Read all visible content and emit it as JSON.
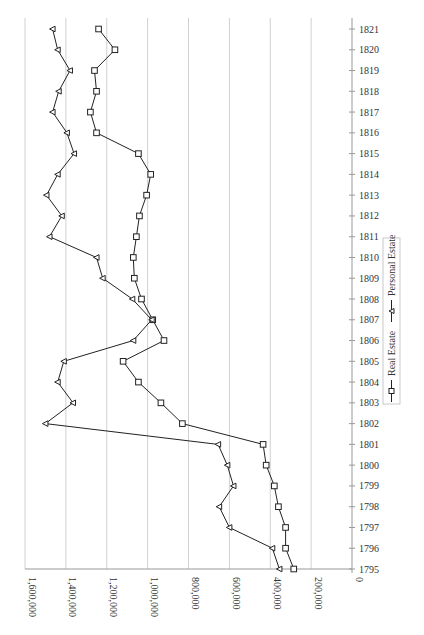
{
  "chart_data": {
    "type": "line",
    "orientation": "rotated-90-clockwise",
    "title": "",
    "xlabel": "",
    "ylabel": "",
    "x": [
      1795,
      1796,
      1797,
      1798,
      1799,
      1800,
      1801,
      1802,
      1803,
      1804,
      1805,
      1806,
      1807,
      1808,
      1809,
      1810,
      1811,
      1812,
      1813,
      1814,
      1815,
      1816,
      1817,
      1818,
      1819,
      1820,
      1821
    ],
    "x_tick_labels": [
      "1795",
      "1796",
      "1797",
      "1798",
      "1799",
      "1800",
      "1801",
      "1802",
      "1803",
      "1804",
      "1805",
      "1806",
      "1807",
      "1808",
      "1809",
      "1810",
      "1811",
      "1812",
      "1813",
      "1814",
      "1815",
      "1816",
      "1817",
      "1818",
      "1819",
      "1820",
      "1821"
    ],
    "y_tick_labels": [
      "0",
      "200,000",
      "400,000",
      "600,000",
      "800,000",
      "1,000,000",
      "1,200,000",
      "1,400,000",
      "1,600,000"
    ],
    "y_ticks": [
      0,
      200000,
      400000,
      600000,
      800000,
      1000000,
      1200000,
      1400000,
      1600000
    ],
    "ylim": [
      0,
      1600000
    ],
    "grid": true,
    "legend_position": "right",
    "series": [
      {
        "name": "Real Estate",
        "marker": "square",
        "values": [
          285000,
          325000,
          325000,
          360000,
          380000,
          420000,
          435000,
          830000,
          935000,
          1045000,
          1120000,
          920000,
          975000,
          1030000,
          1065000,
          1070000,
          1055000,
          1040000,
          1005000,
          985000,
          1045000,
          1250000,
          1280000,
          1250000,
          1260000,
          1160000,
          1240000
        ]
      },
      {
        "name": "Personal Estate",
        "marker": "triangle",
        "values": [
          355000,
          390000,
          600000,
          650000,
          580000,
          610000,
          655000,
          1500000,
          1365000,
          1440000,
          1410000,
          1070000,
          980000,
          1075000,
          1220000,
          1250000,
          1480000,
          1420000,
          1495000,
          1440000,
          1360000,
          1395000,
          1465000,
          1435000,
          1380000,
          1440000,
          1465000
        ]
      }
    ]
  },
  "legend": {
    "items": [
      {
        "label": "Real Estate",
        "marker": "square"
      },
      {
        "label": "Personal Estate",
        "marker": "triangle"
      }
    ]
  },
  "colors": {
    "line": "#222222",
    "grid": "#d0d0d0",
    "axis": "#999999",
    "text": "#333333"
  }
}
